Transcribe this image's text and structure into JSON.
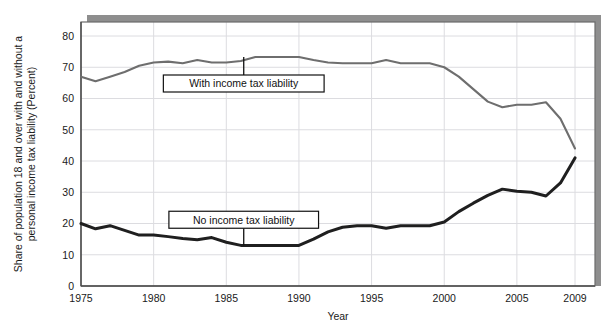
{
  "chart_data": {
    "type": "line",
    "title": "",
    "xlabel": "Year",
    "ylabel": "Share of population 18 and over with and without a personal income tax liability (Percent)",
    "xlim": [
      1975,
      2009
    ],
    "ylim": [
      0,
      85
    ],
    "xticks": [
      "1975",
      "1980",
      "1985",
      "1990",
      "1995",
      "2000",
      "2005",
      "2009"
    ],
    "xtick_values": [
      1975,
      1980,
      1985,
      1990,
      1995,
      2000,
      2005,
      2009
    ],
    "yticks": [
      "0",
      "10",
      "20",
      "30",
      "40",
      "50",
      "60",
      "70",
      "80"
    ],
    "ytick_values": [
      0,
      10,
      20,
      30,
      40,
      50,
      60,
      70,
      80
    ],
    "grid": true,
    "legend_position": "inline-annotations",
    "x": [
      1975,
      1976,
      1977,
      1978,
      1979,
      1980,
      1981,
      1982,
      1983,
      1984,
      1985,
      1986,
      1987,
      1988,
      1989,
      1990,
      1991,
      1992,
      1993,
      1994,
      1995,
      1996,
      1997,
      1998,
      1999,
      2000,
      2001,
      2002,
      2003,
      2004,
      2005,
      2006,
      2007,
      2008,
      2009
    ],
    "series": [
      {
        "name": "With income tax liability",
        "color": "#6e6e6e",
        "width": 2.1,
        "values": [
          67.0,
          65.5,
          67.0,
          68.5,
          70.5,
          71.5,
          71.8,
          71.3,
          72.3,
          71.5,
          71.5,
          72.0,
          73.3,
          73.3,
          73.3,
          73.3,
          72.3,
          71.5,
          71.3,
          71.3,
          71.3,
          72.3,
          71.3,
          71.3,
          71.3,
          70.0,
          67.0,
          63.0,
          59.0,
          57.2,
          58.0,
          58.0,
          58.8,
          53.5,
          44.0
        ]
      },
      {
        "name": "No income tax liability",
        "color": "#1f1f1f",
        "width": 3.0,
        "values": [
          20.0,
          18.3,
          19.3,
          17.8,
          16.3,
          16.3,
          15.8,
          15.2,
          14.8,
          15.5,
          14.0,
          13.0,
          13.0,
          13.0,
          13.0,
          13.0,
          15.0,
          17.3,
          18.8,
          19.3,
          19.3,
          18.5,
          19.3,
          19.3,
          19.3,
          20.5,
          23.8,
          26.5,
          29.0,
          31.0,
          30.3,
          30.0,
          28.8,
          33.0,
          41.0
        ]
      }
    ],
    "annotations": [
      {
        "name": "with-income-tax-liability",
        "label": "With income tax liability",
        "box_x": 1986.2,
        "box_y": 64.8,
        "anchor_x": 1986.2,
        "anchor_y": 73.3
      },
      {
        "name": "no-income-tax-liability",
        "label": "No income tax liability",
        "box_x": 1986.2,
        "box_y": 21.2,
        "anchor_x": 1986.2,
        "anchor_y": 13.0
      }
    ],
    "colors": {
      "grid": "#dcdce0",
      "axis": "#4d4d4d",
      "plot_border": "#6b6b6b",
      "shadow": "#7a7a7a",
      "background": "#ffffff",
      "annotation_border": "#111111"
    }
  }
}
